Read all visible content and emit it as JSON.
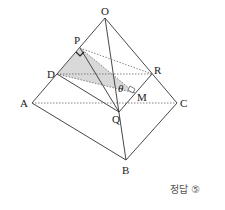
{
  "figure": {
    "type": "tetrahedron-cross-section",
    "vertices": {
      "O": {
        "label": "O",
        "x": 105,
        "y": 18
      },
      "A": {
        "label": "A",
        "x": 32,
        "y": 103
      },
      "B": {
        "label": "B",
        "x": 126,
        "y": 160
      },
      "C": {
        "label": "C",
        "x": 177,
        "y": 103
      },
      "P": {
        "label": "P",
        "x": 80,
        "y": 48
      },
      "D": {
        "label": "D",
        "x": 57,
        "y": 74
      },
      "R": {
        "label": "R",
        "x": 152,
        "y": 74
      },
      "Q": {
        "label": "Q",
        "x": 119,
        "y": 112
      },
      "M": {
        "label": "M",
        "x": 135,
        "y": 93
      }
    },
    "angle_label": "θ",
    "shaded_region": "triangle PDM",
    "colors": {
      "line": "#333333",
      "dashed": "#666666",
      "shade": "#d9d9d9"
    }
  },
  "answer": {
    "text": "정답 ⑤"
  }
}
